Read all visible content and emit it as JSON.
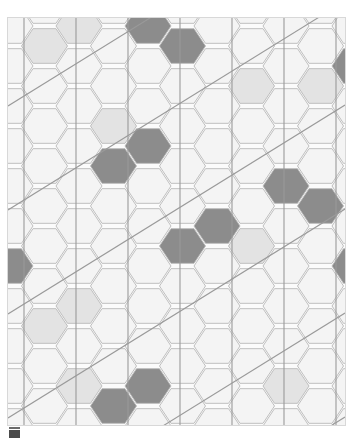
{
  "page": {
    "background_color": "#ffffff",
    "width": 361,
    "height": 442
  },
  "figure": {
    "name": "hexagonal-tiling-pattern",
    "x": 8,
    "y": 18,
    "width": 337,
    "height": 407,
    "background_color": "#fbfbfb",
    "border_color": "#d8d8d8"
  },
  "caption": {
    "mark_text": "",
    "x": 9,
    "y": 430,
    "width": 11,
    "height": 8,
    "color": "#4a4a4a"
  },
  "chart_data": {
    "type": "heatmap",
    "title": "",
    "subtitle": "",
    "xlabel": "",
    "ylabel": "",
    "legend": [
      {
        "name": "base",
        "color": "#f4f4f4",
        "label": ""
      },
      {
        "name": "light",
        "color": "#e3e3e3",
        "label": ""
      },
      {
        "name": "dark",
        "color": "#8c8c8c",
        "label": ""
      }
    ],
    "geometry": {
      "hex_orientation": "flat-top",
      "hex_radius": 23,
      "col_pitch": 34.5,
      "row_pitch": 40,
      "cols": 11,
      "rows": 12,
      "origin_x": 2,
      "origin_y": 8
    },
    "grid": {
      "on": true,
      "hex_stroke": "#b9b9b9",
      "vertical_line_color": "#9a9a9a",
      "vertical_line_spacing": 52,
      "vertical_line_offset": 16,
      "diagonal_line_color": "#9a9a9a",
      "diagonal_slope": -0.62,
      "diagonal_spacing": 104,
      "diagonal_offset": -120
    },
    "categories": [
      "base",
      "light",
      "dark"
    ],
    "values": [
      282,
      14,
      22
    ],
    "cells_light": [
      {
        "col": 2,
        "row": 0
      },
      {
        "col": 7,
        "row": 1
      },
      {
        "col": 7,
        "row": 5
      },
      {
        "col": 2,
        "row": 7
      },
      {
        "col": 2,
        "row": 9
      },
      {
        "col": 8,
        "row": 9
      },
      {
        "col": 4,
        "row": 9
      },
      {
        "col": 1,
        "row": 7
      },
      {
        "col": 6,
        "row": 5
      },
      {
        "col": 3,
        "row": 2
      },
      {
        "col": 9,
        "row": 1
      },
      {
        "col": 1,
        "row": 0
      },
      {
        "col": 5,
        "row": 10
      },
      {
        "col": 10,
        "row": 6
      }
    ],
    "cells_dark": [
      {
        "col": 4,
        "row": 0
      },
      {
        "col": 5,
        "row": 0
      },
      {
        "col": 10,
        "row": 1
      },
      {
        "col": 11,
        "row": 1
      },
      {
        "col": 3,
        "row": 3
      },
      {
        "col": 4,
        "row": 3
      },
      {
        "col": 8,
        "row": 4
      },
      {
        "col": 9,
        "row": 4
      },
      {
        "col": 5,
        "row": 5
      },
      {
        "col": 6,
        "row": 5
      },
      {
        "col": 0,
        "row": 6
      },
      {
        "col": 10,
        "row": 6
      },
      {
        "col": 11,
        "row": 6
      },
      {
        "col": 3,
        "row": 9
      },
      {
        "col": 4,
        "row": 9
      },
      {
        "col": 6,
        "row": 11
      },
      {
        "col": 7,
        "row": 11
      }
    ]
  }
}
